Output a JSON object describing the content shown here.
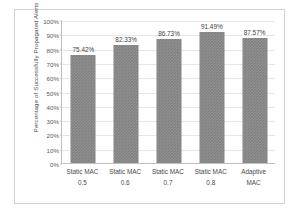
{
  "chart_data": {
    "type": "bar",
    "title": "",
    "xlabel": "",
    "ylabel": "Percentage of Successfully Propagated Alerts",
    "categories": [
      "Static MAC 0.5",
      "Static MAC 0.6",
      "Static MAC 0.7",
      "Static MAC 0.8",
      "Adaptive MAC"
    ],
    "category_lines": [
      [
        "Static MAC",
        "0.5"
      ],
      [
        "Static MAC",
        "0.6"
      ],
      [
        "Static MAC",
        "0.7"
      ],
      [
        "Static MAC",
        "0.8"
      ],
      [
        "Adaptive",
        "MAC"
      ]
    ],
    "values": [
      75.42,
      82.33,
      86.73,
      91.49,
      87.57
    ],
    "data_labels": [
      "75.42%",
      "82.33%",
      "86.73%",
      "91.49%",
      "87.57%"
    ],
    "ylim": [
      0,
      100
    ],
    "yticks": [
      0,
      10,
      20,
      30,
      40,
      50,
      60,
      70,
      80,
      90,
      100
    ],
    "ytick_labels": [
      "0%",
      "10%",
      "20%",
      "30%",
      "40%",
      "50%",
      "60%",
      "70%",
      "80%",
      "90%",
      "100%"
    ],
    "grid": true,
    "legend": false,
    "bar_color": "#808080",
    "gridline_color": "#e6e6e6",
    "axis_color": "#bfbfbf",
    "frame_color": "#d2d2d2",
    "background": "#ffffff"
  }
}
